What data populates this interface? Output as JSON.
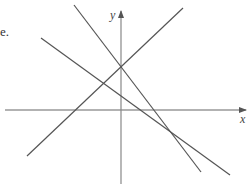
{
  "text_fragment": "e.",
  "axes": {
    "x_label": "x",
    "y_label": "y",
    "origin_px": [
      121,
      110
    ],
    "x_axis": {
      "from": [
        5,
        110
      ],
      "to": [
        246,
        110
      ]
    },
    "y_axis": {
      "from": [
        121,
        184
      ],
      "to": [
        121,
        11
      ]
    }
  },
  "lines": [
    {
      "name": "rising-line",
      "from": [
        27,
        156
      ],
      "to": [
        183,
        8
      ],
      "color": "#555555"
    },
    {
      "name": "steep-falling-line",
      "from": [
        74,
        5
      ],
      "to": [
        201,
        172
      ],
      "color": "#555555"
    },
    {
      "name": "shallow-falling-line",
      "from": [
        41,
        38
      ],
      "to": [
        230,
        175
      ],
      "color": "#555555"
    }
  ],
  "intersections": [
    {
      "label": "rising/steep on y-axis",
      "px": [
        121,
        67
      ]
    },
    {
      "label": "steep/shallow",
      "px": [
        172,
        132
      ]
    }
  ]
}
